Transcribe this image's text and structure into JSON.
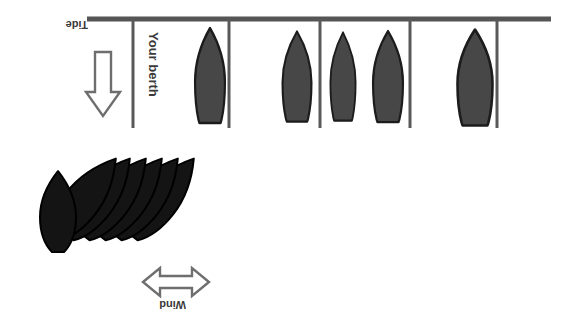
{
  "diagram": {
    "colors": {
      "pontoon": "#555555",
      "finger_pier": "#595959",
      "moored_boat_fill": "#474747",
      "moored_boat_stroke": "#1c1c1c",
      "rafted_boat_fill": "#141414",
      "rafted_boat_stroke": "#000000",
      "arrow_stroke": "#6e6e6e",
      "arrow_fill": "#ffffff",
      "label_text": "#3a3a3a",
      "background": "#ffffff"
    },
    "labels": {
      "tide": "Tide",
      "berth": "Your berth",
      "wind": "Wind"
    },
    "arrows": {
      "tide": {
        "name": "tide-arrow",
        "direction": "down",
        "heads": 1
      },
      "wind": {
        "name": "wind-arrow",
        "direction": "horizontal",
        "heads": 2
      }
    },
    "pontoon": {
      "name": "main-pontoon",
      "x1": 87,
      "y1": 19,
      "x2": 551,
      "y2": 19,
      "thickness": 5
    },
    "finger_piers": [
      {
        "name": "finger-pier-1",
        "x": 133,
        "y_top": 19,
        "y_bottom": 128
      },
      {
        "name": "finger-pier-2",
        "x": 229,
        "y_top": 19,
        "y_bottom": 128
      },
      {
        "name": "finger-pier-3",
        "x": 320,
        "y_top": 19,
        "y_bottom": 128
      },
      {
        "name": "finger-pier-4",
        "x": 410,
        "y_top": 19,
        "y_bottom": 128
      },
      {
        "name": "finger-pier-5",
        "x": 497,
        "y_top": 19,
        "y_bottom": 128
      }
    ],
    "moored_boats": [
      {
        "name": "moored-boat-1",
        "cx": 210,
        "top": 28,
        "width": 30,
        "height": 95
      },
      {
        "name": "moored-boat-2",
        "cx": 297,
        "top": 31,
        "width": 29,
        "height": 90
      },
      {
        "name": "moored-boat-3",
        "cx": 343,
        "top": 32,
        "width": 25,
        "height": 88
      },
      {
        "name": "moored-boat-4",
        "cx": 388,
        "top": 31,
        "width": 30,
        "height": 91
      },
      {
        "name": "moored-boat-5",
        "cx": 475,
        "top": 30,
        "width": 35,
        "height": 96
      }
    ],
    "raft": {
      "name": "rafted-boat-cluster",
      "lead_boat": {
        "name": "rafted-boat-lead",
        "cx": 58,
        "cy": 212,
        "width": 36,
        "height": 80,
        "rotation": 0
      },
      "trailing_boats": [
        {
          "name": "rafted-boat-1",
          "cx": 88,
          "cy": 196,
          "width": 36,
          "height": 96,
          "rotation": 38
        },
        {
          "name": "rafted-boat-2",
          "cx": 105,
          "cy": 196,
          "width": 36,
          "height": 96,
          "rotation": 38
        },
        {
          "name": "rafted-boat-3",
          "cx": 122,
          "cy": 196,
          "width": 36,
          "height": 96,
          "rotation": 38
        },
        {
          "name": "rafted-boat-4",
          "cx": 139,
          "cy": 196,
          "width": 36,
          "height": 96,
          "rotation": 38
        },
        {
          "name": "rafted-boat-5",
          "cx": 156,
          "cy": 196,
          "width": 36,
          "height": 96,
          "rotation": 38
        },
        {
          "name": "rafted-boat-6",
          "cx": 170,
          "cy": 196,
          "width": 36,
          "height": 96,
          "rotation": 38
        }
      ]
    }
  }
}
